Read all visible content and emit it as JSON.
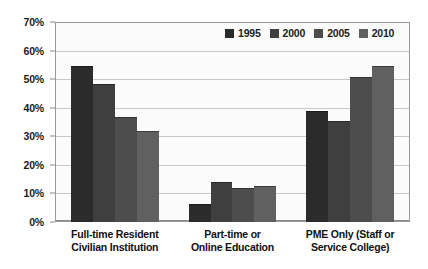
{
  "chart_data": {
    "type": "bar",
    "title": "",
    "subtitle": "",
    "xlabel": "",
    "ylabel": "",
    "ylim": [
      0,
      70
    ],
    "ytick_labels": [
      "0%",
      "10%",
      "20%",
      "30%",
      "40%",
      "50%",
      "60%",
      "70%"
    ],
    "ytick_values": [
      0,
      10,
      20,
      30,
      40,
      50,
      60,
      70
    ],
    "grid": true,
    "legend_position": "top-right",
    "categories": [
      "Full-time Resident Civilian Institution",
      "Part-time or Online Education",
      "PME Only (Staff or Service College)"
    ],
    "category_lines": [
      [
        "Full-time Resident",
        "Civilian Institution"
      ],
      [
        "Part-time or",
        "Online Education"
      ],
      [
        "PME Only (Staff or",
        "Service College)"
      ]
    ],
    "series": [
      {
        "name": "1995",
        "color": "#2b2b2b",
        "values": [
          55,
          6.5,
          39
        ]
      },
      {
        "name": "2000",
        "color": "#3f3f3f",
        "values": [
          48.5,
          14,
          35.5
        ]
      },
      {
        "name": "2005",
        "color": "#4d4d4d",
        "values": [
          37,
          12,
          51
        ]
      },
      {
        "name": "2010",
        "color": "#606060",
        "values": [
          32,
          12.5,
          55
        ]
      }
    ]
  },
  "colors": {
    "plot_background": "#fbfbfb",
    "plot_border": "#9a9a9a",
    "gridline": "#c9c9c9",
    "axis_text": "#1c1c1c",
    "category_text": "#111111"
  }
}
